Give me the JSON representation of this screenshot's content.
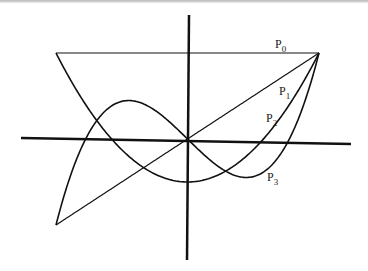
{
  "chart_data": {
    "type": "line",
    "title": "",
    "xlabel": "",
    "ylabel": "",
    "xlim": [
      -1,
      1
    ],
    "ylim": [
      -1,
      1
    ],
    "grid": false,
    "legend": "inline labels at right",
    "series": [
      {
        "name": "P0",
        "label_main": "P",
        "label_sub": "0",
        "expression": "1",
        "x": [
          -1,
          -0.5,
          0,
          0.5,
          1
        ],
        "values": [
          1,
          1,
          1,
          1,
          1
        ]
      },
      {
        "name": "P1",
        "label_main": "P",
        "label_sub": "1",
        "expression": "x",
        "x": [
          -1,
          -0.5,
          0,
          0.5,
          1
        ],
        "values": [
          -1,
          -0.5,
          0,
          0.5,
          1
        ]
      },
      {
        "name": "P2",
        "label_main": "P",
        "label_sub": "2",
        "expression": "(3x^2-1)/2",
        "x": [
          -1,
          -0.5,
          0,
          0.5,
          1
        ],
        "values": [
          1,
          -0.125,
          -0.5,
          -0.125,
          1
        ]
      },
      {
        "name": "P3",
        "label_main": "P",
        "label_sub": "3",
        "expression": "(5x^3-3x)/2",
        "x": [
          -1,
          -0.5,
          0,
          0.5,
          1
        ],
        "values": [
          -1,
          0.4375,
          0,
          -0.4375,
          1
        ]
      }
    ]
  }
}
